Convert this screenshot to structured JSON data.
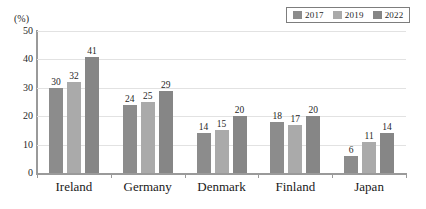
{
  "chart_data": {
    "type": "bar",
    "title": "",
    "subtitle": "",
    "xlabel": "",
    "ylabel": "",
    "unit_label": "(%)",
    "categories": [
      "Ireland",
      "Germany",
      "Denmark",
      "Finland",
      "Japan"
    ],
    "series": [
      {
        "name": "2017",
        "values": [
          30,
          24,
          14,
          18,
          6
        ],
        "color": "#8c8c8c"
      },
      {
        "name": "2019",
        "values": [
          32,
          25,
          15,
          17,
          11
        ],
        "color": "#aaaaaa"
      },
      {
        "name": "2022",
        "values": [
          41,
          29,
          20,
          20,
          14
        ],
        "color": "#868686"
      }
    ],
    "ylim": [
      0,
      50
    ],
    "yticks": [
      0,
      10,
      20,
      30,
      40,
      50
    ],
    "ytick_labels": [
      "0",
      "10",
      "20",
      "30",
      "40",
      "50"
    ],
    "grid": true,
    "grid_axis": "y",
    "legend_position": "top-right",
    "data_labels": true
  },
  "legend": {
    "items": [
      {
        "label": "2017",
        "color": "#8c8c8c"
      },
      {
        "label": "2019",
        "color": "#aaaaaa"
      },
      {
        "label": "2022",
        "color": "#868686"
      }
    ]
  },
  "colors": {
    "axis": "#9a9a9a",
    "grid": "#e2e2e2",
    "text": "#1f1f1f",
    "background": "#ffffff",
    "legend_border": "#7d7d7d"
  }
}
